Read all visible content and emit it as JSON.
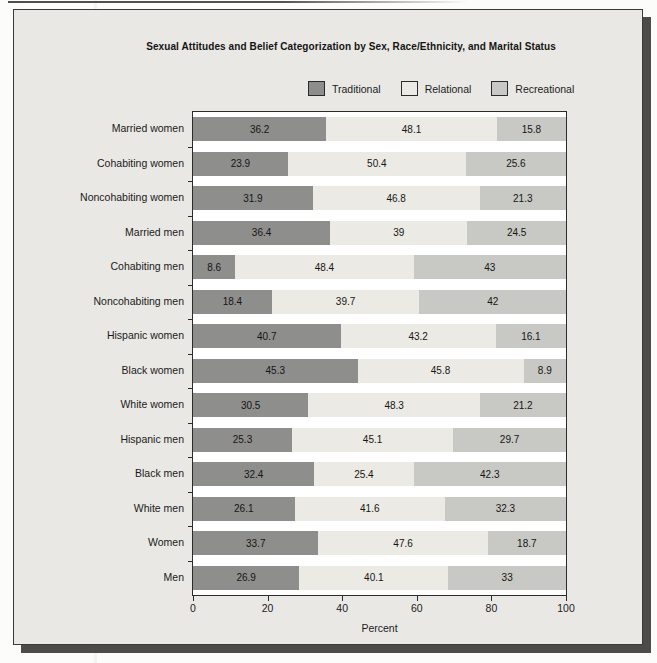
{
  "figure": {
    "title": "Sexual Attitudes and Belief Categorization by Sex, Race/Ethnicity, and Marital Status",
    "xlabel": "Percent"
  },
  "chart_data": {
    "type": "bar",
    "orientation": "horizontal",
    "stacked": true,
    "title": "Sexual Attitudes and Belief Categorization by Sex, Race/Ethnicity, and Marital Status",
    "xlabel": "Percent",
    "xlim": [
      0,
      100
    ],
    "xticks": [
      0,
      20,
      40,
      60,
      80,
      100
    ],
    "legend_position": "top",
    "grid": false,
    "categories": [
      "Married women",
      "Cohabiting women",
      "Noncohabiting women",
      "Married men",
      "Cohabiting men",
      "Noncohabiting men",
      "Hispanic women",
      "Black women",
      "White women",
      "Hispanic men",
      "Black men",
      "White men",
      "Women",
      "Men"
    ],
    "series": [
      {
        "name": "Traditional",
        "color": "#8e8e8c",
        "values": [
          36.2,
          23.9,
          31.9,
          36.4,
          8.6,
          18.4,
          40.7,
          45.3,
          30.5,
          25.3,
          32.4,
          26.1,
          33.7,
          26.9
        ]
      },
      {
        "name": "Relational",
        "color": "#eceae4",
        "values": [
          48.1,
          50.4,
          46.8,
          39,
          48.4,
          39.7,
          43.2,
          45.8,
          48.3,
          45.1,
          25.4,
          41.6,
          47.6,
          40.1
        ]
      },
      {
        "name": "Recreational",
        "color": "#c8c8c4",
        "values": [
          15.8,
          25.6,
          21.3,
          24.5,
          43,
          42,
          16.1,
          8.9,
          21.2,
          29.7,
          42.3,
          32.3,
          18.7,
          33
        ]
      }
    ]
  }
}
